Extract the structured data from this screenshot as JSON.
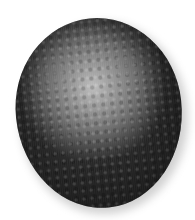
{
  "image": {
    "subject": "ovoid-cell-textured-sphere",
    "background_color": "#ffffff",
    "colors": {
      "highlight": "#bdbdbd",
      "midtone": "#6a6a6a",
      "shadow": "#262626"
    }
  }
}
